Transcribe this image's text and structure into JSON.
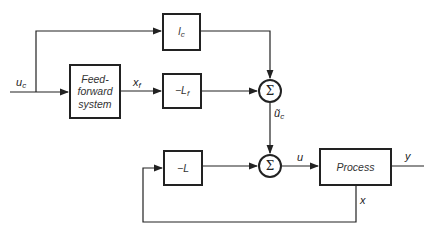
{
  "diagram": {
    "type": "block-diagram",
    "inputs": {
      "uc": "u",
      "uc_sub": "c"
    },
    "blocks": {
      "lc": {
        "main": "l",
        "sub": "c"
      },
      "feedforward": {
        "line1": "Feed-",
        "line2": "forward",
        "line3": "system"
      },
      "lf": {
        "main": "−L",
        "sub": "f"
      },
      "l": {
        "main": "−L"
      },
      "process": {
        "label": "Process"
      }
    },
    "sums": {
      "sum1": "Σ",
      "sum2": "Σ"
    },
    "signals": {
      "xf": "x",
      "xf_sub": "f",
      "uc_tilde": "ũ",
      "uc_tilde_sub": "c",
      "u": "u",
      "y": "y",
      "x": "x"
    },
    "colors": {
      "line": "#222222",
      "background": "#ffffff"
    }
  }
}
